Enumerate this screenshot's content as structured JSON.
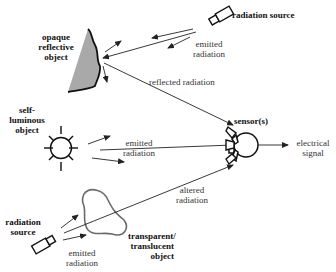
{
  "diagram": {
    "type": "flow",
    "title": "",
    "nodes": [
      {
        "id": "opaque",
        "label_lines": [
          "opaque",
          "reflective",
          "object"
        ]
      },
      {
        "id": "source_top",
        "label": "radiation source"
      },
      {
        "id": "self_luminous",
        "label_lines": [
          "self-",
          "luminous",
          "object"
        ]
      },
      {
        "id": "sensor",
        "label": "sensor(s)"
      },
      {
        "id": "source_bottom",
        "label_lines": [
          "radiation",
          "source"
        ]
      },
      {
        "id": "transparent",
        "label_lines": [
          "transparent/",
          "translucent",
          "object"
        ]
      },
      {
        "id": "output",
        "label_lines": [
          "electrical",
          "signal"
        ]
      }
    ],
    "edges": [
      {
        "from": "source_top",
        "to": "opaque",
        "label_lines": [
          "emitted",
          "radiation"
        ]
      },
      {
        "from": "opaque",
        "to": "sensor",
        "label": "reflected radiation"
      },
      {
        "from": "self_luminous",
        "to": "sensor",
        "label_lines": [
          "emitted",
          "radiation"
        ]
      },
      {
        "from": "source_bottom",
        "to": "transparent",
        "label_lines": [
          "emitted",
          "radiation"
        ]
      },
      {
        "from": "transparent",
        "to": "sensor",
        "label_lines": [
          "altered",
          "radiation"
        ]
      },
      {
        "from": "sensor",
        "to": "output",
        "label": ""
      }
    ]
  },
  "labels": {
    "opaque": [
      "opaque",
      "reflective",
      "object"
    ],
    "source_top": "radiation source",
    "emitted_top": [
      "emitted",
      "radiation"
    ],
    "reflected": "reflected radiation",
    "self_luminous": [
      "self-",
      "luminous",
      "object"
    ],
    "emitted_mid": [
      "emitted",
      "radiation"
    ],
    "sensor": "sensor(s)",
    "electrical": [
      "electrical",
      "signal"
    ],
    "altered": [
      "altered",
      "radiation"
    ],
    "source_bottom": [
      "radiation",
      "source"
    ],
    "emitted_bottom": [
      "emitted",
      "radiation"
    ],
    "transparent": [
      "transparent/",
      "translucent",
      "object"
    ]
  },
  "colors": {
    "line": "#222222",
    "object_fill": "#a9a9a9",
    "blob_stroke": "#666666"
  }
}
